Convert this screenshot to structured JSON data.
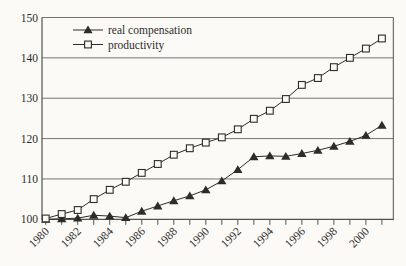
{
  "colors": {
    "background": "#fbfaf6",
    "ink": "#2e2c29",
    "grid": "#55524e",
    "marker_fill_open": "#fbfaf6"
  },
  "legend": {
    "items": [
      {
        "label": "real compensation",
        "marker": "filled-triangle"
      },
      {
        "label": "productivity",
        "marker": "open-square"
      }
    ]
  },
  "chart_data": {
    "type": "line",
    "title": "",
    "xlabel": "",
    "ylabel": "",
    "grid": "horizontal",
    "legend_position": "top-left-inside",
    "ylim": [
      100,
      150
    ],
    "yticks": [
      100,
      110,
      120,
      130,
      140,
      150
    ],
    "ytick_labels": [
      "100",
      "110",
      "120",
      "130",
      "140",
      "150"
    ],
    "x": [
      1980,
      1981,
      1982,
      1983,
      1984,
      1985,
      1986,
      1987,
      1988,
      1989,
      1990,
      1991,
      1992,
      1993,
      1994,
      1995,
      1996,
      1997,
      1998,
      1999,
      2000,
      2001
    ],
    "xtick_label_years": [
      1980,
      1982,
      1984,
      1986,
      1988,
      1990,
      1992,
      1994,
      1996,
      1998,
      2000
    ],
    "xtick_labels": [
      "1980",
      "1982",
      "1984",
      "1986",
      "1988",
      "1990",
      "1992",
      "1994",
      "1996",
      "1998",
      "2000"
    ],
    "series": [
      {
        "name": "real compensation",
        "marker": "filled-triangle",
        "values": [
          100,
          100.1,
          100.3,
          101.0,
          100.8,
          100.4,
          102.0,
          103.3,
          104.6,
          105.8,
          107.3,
          109.5,
          112.3,
          115.5,
          115.7,
          115.6,
          116.3,
          117.1,
          118.1,
          119.3,
          120.8,
          123.3
        ]
      },
      {
        "name": "productivity",
        "marker": "open-square",
        "values": [
          100.2,
          101.3,
          102.3,
          105.0,
          107.3,
          109.3,
          111.5,
          113.7,
          116.0,
          117.6,
          119.0,
          120.3,
          122.3,
          124.9,
          126.9,
          129.8,
          133.3,
          135.0,
          137.7,
          140.0,
          142.3,
          144.8
        ]
      }
    ]
  }
}
